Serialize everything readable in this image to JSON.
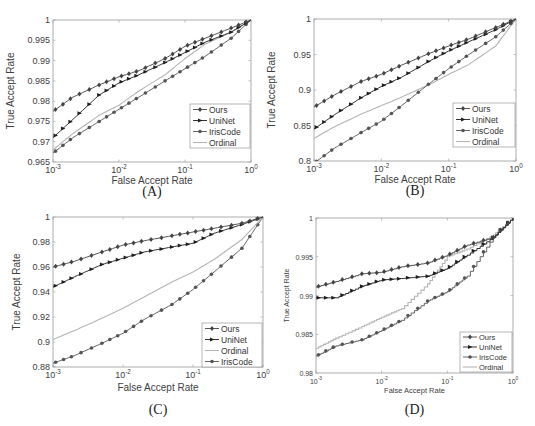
{
  "chart_data": [
    {
      "type": "line",
      "panel_label": "(A)",
      "xlabel": "False Accept Rate",
      "ylabel": "True Accept Rate",
      "xscale": "log",
      "xlim": [
        0.001,
        1
      ],
      "ylim": [
        0.965,
        1
      ],
      "xticks": [
        "10^-3",
        "10^-2",
        "10^-1",
        "10^0"
      ],
      "yticks": [
        "0.965",
        "0.97",
        "0.975",
        "0.98",
        "0.985",
        "0.99",
        "0.995",
        "1"
      ],
      "grid": false,
      "legend_position": "lower right",
      "x": [
        0.001,
        0.002,
        0.005,
        0.01,
        0.02,
        0.05,
        0.1,
        0.2,
        0.5,
        1
      ],
      "series": [
        {
          "name": "Ours",
          "values": [
            0.9775,
            0.981,
            0.984,
            0.986,
            0.9875,
            0.9905,
            0.9935,
            0.9955,
            0.998,
            1.0
          ]
        },
        {
          "name": "UniNet",
          "values": [
            0.971,
            0.9755,
            0.9815,
            0.9845,
            0.9865,
            0.9895,
            0.992,
            0.9945,
            0.997,
            1.0
          ]
        },
        {
          "name": "IrisCode",
          "values": [
            0.9672,
            0.971,
            0.975,
            0.978,
            0.981,
            0.985,
            0.988,
            0.991,
            0.9955,
            1.0
          ]
        },
        {
          "name": "Ordinal",
          "values": [
            0.968,
            0.972,
            0.9765,
            0.979,
            0.9825,
            0.9865,
            0.9905,
            0.994,
            0.997,
            1.0
          ]
        }
      ]
    },
    {
      "type": "line",
      "panel_label": "(B)",
      "xlabel": "False Accept Rate",
      "ylabel": "True Accept Rate",
      "xscale": "log",
      "xlim": [
        0.001,
        1
      ],
      "ylim": [
        0.8,
        1
      ],
      "xticks": [
        "10^-3",
        "10^-2",
        "10^-1",
        "10^0"
      ],
      "yticks": [
        "0.8",
        "0.85",
        "0.9",
        "0.95",
        "1"
      ],
      "grid": false,
      "legend_position": "lower right",
      "x": [
        0.001,
        0.002,
        0.005,
        0.01,
        0.02,
        0.05,
        0.1,
        0.2,
        0.5,
        1
      ],
      "series": [
        {
          "name": "Ours",
          "values": [
            0.876,
            0.893,
            0.912,
            0.922,
            0.935,
            0.951,
            0.962,
            0.972,
            0.988,
            1.0
          ]
        },
        {
          "name": "UniNet",
          "values": [
            0.845,
            0.865,
            0.889,
            0.905,
            0.918,
            0.94,
            0.955,
            0.968,
            0.985,
            1.0
          ]
        },
        {
          "name": "IrisCode",
          "values": [
            0.797,
            0.818,
            0.84,
            0.856,
            0.878,
            0.908,
            0.93,
            0.95,
            0.975,
            1.0
          ]
        },
        {
          "name": "Ordinal",
          "values": [
            0.832,
            0.848,
            0.866,
            0.878,
            0.89,
            0.907,
            0.922,
            0.936,
            0.962,
            1.0
          ]
        }
      ]
    },
    {
      "type": "line",
      "panel_label": "(C)",
      "xlabel": "False Accept Rate",
      "ylabel": "True Accept Rate",
      "xscale": "log",
      "xlim": [
        0.001,
        1
      ],
      "ylim": [
        0.88,
        1
      ],
      "xticks": [
        "10^-3",
        "10^-2",
        "10^-1",
        "10^0"
      ],
      "yticks": [
        "0.88",
        "0.9",
        "0.92",
        "0.94",
        "0.96",
        "0.98",
        "1"
      ],
      "grid": false,
      "legend_position": "lower right",
      "x": [
        0.001,
        0.002,
        0.005,
        0.01,
        0.02,
        0.05,
        0.1,
        0.2,
        0.5,
        1
      ],
      "series": [
        {
          "name": "Ours",
          "values": [
            0.96,
            0.9645,
            0.972,
            0.9775,
            0.981,
            0.985,
            0.988,
            0.991,
            0.995,
            1.0
          ]
        },
        {
          "name": "UniNet",
          "values": [
            0.944,
            0.952,
            0.962,
            0.967,
            0.972,
            0.976,
            0.979,
            0.987,
            0.994,
            1.0
          ]
        },
        {
          "name": "Ordinal",
          "values": [
            0.902,
            0.909,
            0.919,
            0.927,
            0.936,
            0.948,
            0.956,
            0.966,
            0.982,
            1.0
          ]
        },
        {
          "name": "IrisCode",
          "values": [
            0.883,
            0.889,
            0.899,
            0.907,
            0.918,
            0.93,
            0.942,
            0.956,
            0.975,
            1.0
          ]
        }
      ]
    },
    {
      "type": "line",
      "panel_label": "(D)",
      "xlabel": "False Accept Rate",
      "ylabel": "True Accept Rate",
      "xscale": "log",
      "xlim": [
        0.001,
        1
      ],
      "ylim": [
        0.98,
        1
      ],
      "xticks": [
        "10^-3",
        "10^-2",
        "10^-1",
        "10^0"
      ],
      "yticks": [
        "0.98",
        "0.985",
        "0.99",
        "0.995",
        "1"
      ],
      "grid": false,
      "legend_position": "lower right",
      "x": [
        0.001,
        0.002,
        0.005,
        0.01,
        0.02,
        0.05,
        0.1,
        0.2,
        0.5,
        1
      ],
      "series": [
        {
          "name": "Ours",
          "values": [
            0.9911,
            0.9918,
            0.9928,
            0.993,
            0.9937,
            0.9942,
            0.9952,
            0.9965,
            0.9975,
            1.0
          ]
        },
        {
          "name": "UniNet",
          "values": [
            0.9897,
            0.9897,
            0.9912,
            0.992,
            0.9922,
            0.9925,
            0.9935,
            0.9952,
            0.9975,
            1.0
          ]
        },
        {
          "name": "IrisCode",
          "values": [
            0.9822,
            0.9835,
            0.9843,
            0.9855,
            0.9868,
            0.9893,
            0.9905,
            0.9925,
            0.9975,
            1.0
          ]
        },
        {
          "name": "Ordinal",
          "values": [
            0.9832,
            0.9845,
            0.986,
            0.9872,
            0.9883,
            0.9915,
            0.995,
            0.996,
            0.9978,
            1.0
          ]
        }
      ]
    }
  ],
  "style": {
    "series_colors": {
      "Ours": "#444444",
      "UniNet": "#1e1e1e",
      "IrisCode": "#555555",
      "Ordinal": "#b4b4b4"
    },
    "series_markers": {
      "Ours": "diamond",
      "UniNet": "triangle-right",
      "IrisCode": "circle",
      "Ordinal": "none"
    },
    "axis_color": "#9a9a9a"
  }
}
